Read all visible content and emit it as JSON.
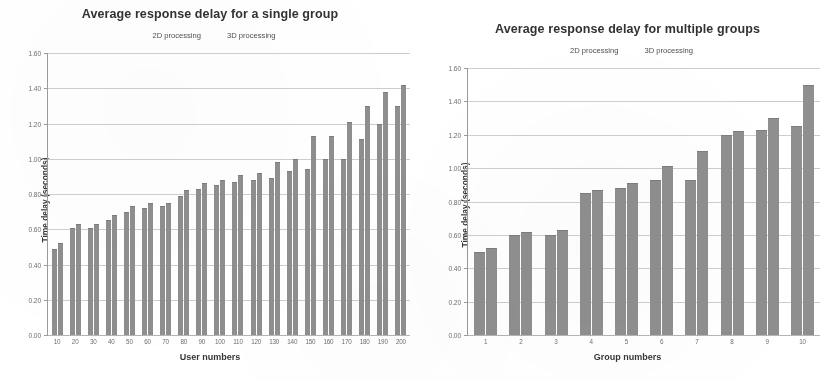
{
  "colors": {
    "bar_2d": "#8d8d8d",
    "bar_3d": "#8d8d8d",
    "gridline": "#cfcfcf",
    "axis": "#9a9a9a",
    "text": "#3a3a3a",
    "background": "#ffffff"
  },
  "legend": {
    "series_2d": "2D processing",
    "series_3d": "3D processing"
  },
  "chart_data": [
    {
      "type": "bar",
      "id": "single-group",
      "title": "Average response delay for a single group",
      "xlabel": "User numbers",
      "ylabel": "Time delay (seconds)",
      "ylim": [
        0.0,
        1.6
      ],
      "yticks": [
        "0.00",
        "0.20",
        "0.40",
        "0.60",
        "0.80",
        "1.00",
        "1.20",
        "1.40",
        "1.60"
      ],
      "ytick_values": [
        0.0,
        0.2,
        0.4,
        0.6,
        0.8,
        1.0,
        1.2,
        1.4,
        1.6
      ],
      "grid": true,
      "legend_position": "top-center",
      "categories": [
        "10",
        "20",
        "30",
        "40",
        "50",
        "60",
        "70",
        "80",
        "90",
        "100",
        "110",
        "120",
        "130",
        "140",
        "150",
        "160",
        "170",
        "180",
        "190",
        "200"
      ],
      "series": [
        {
          "name": "2D processing",
          "values": [
            0.49,
            0.61,
            0.61,
            0.65,
            0.7,
            0.72,
            0.73,
            0.79,
            0.83,
            0.85,
            0.87,
            0.88,
            0.89,
            0.93,
            0.94,
            1.0,
            1.0,
            1.11,
            1.2,
            1.3
          ]
        },
        {
          "name": "3D processing",
          "values": [
            0.52,
            0.63,
            0.63,
            0.68,
            0.73,
            0.75,
            0.75,
            0.82,
            0.86,
            0.88,
            0.91,
            0.92,
            0.98,
            1.0,
            1.13,
            1.13,
            1.21,
            1.3,
            1.38,
            1.42
          ]
        }
      ]
    },
    {
      "type": "bar",
      "id": "multiple-groups",
      "title": "Average response delay for multiple groups",
      "xlabel": "Group numbers",
      "ylabel": "Time delay (seconds)",
      "ylim": [
        0.0,
        1.6
      ],
      "yticks": [
        "0.00",
        "0.20",
        "0.40",
        "0.60",
        "0.80",
        "1.00",
        "1.20",
        "1.40",
        "1.60"
      ],
      "ytick_values": [
        0.0,
        0.2,
        0.4,
        0.6,
        0.8,
        1.0,
        1.2,
        1.4,
        1.6
      ],
      "grid": true,
      "legend_position": "top-center",
      "categories": [
        "1",
        "2",
        "3",
        "4",
        "5",
        "6",
        "7",
        "8",
        "9",
        "10"
      ],
      "series": [
        {
          "name": "2D processing",
          "values": [
            0.5,
            0.6,
            0.6,
            0.85,
            0.88,
            0.93,
            0.93,
            1.2,
            1.23,
            1.25
          ]
        },
        {
          "name": "3D processing",
          "values": [
            0.52,
            0.62,
            0.63,
            0.87,
            0.91,
            1.01,
            1.1,
            1.22,
            1.3,
            1.5
          ]
        }
      ]
    }
  ]
}
